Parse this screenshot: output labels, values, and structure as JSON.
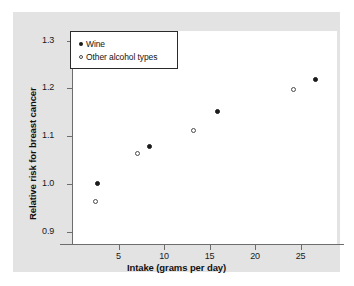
{
  "chart_data": {
    "type": "scatter",
    "title": "",
    "xlabel": "Intake (grams per day)",
    "ylabel": "Relative risk for breast cancer",
    "xlim": [
      0,
      29
    ],
    "ylim": [
      0.875,
      1.32
    ],
    "xticks": [
      5,
      10,
      15,
      20,
      25
    ],
    "xticklabels": [
      "5",
      "10",
      "15",
      "20",
      "25"
    ],
    "yticks": [
      0.9,
      1.0,
      1.1,
      1.2,
      1.3
    ],
    "yticklabels": [
      "0.9",
      "1.0",
      "1.1",
      "1.2",
      "1.3"
    ],
    "grid": false,
    "legend_position": "upper left",
    "series": [
      {
        "name": "Wine",
        "marker": "filled-circle",
        "color": "#1b1b1b",
        "points": [
          {
            "x": 2.7,
            "y": 1.0
          },
          {
            "x": 8.5,
            "y": 1.078
          },
          {
            "x": 15.9,
            "y": 1.151
          },
          {
            "x": 26.7,
            "y": 1.218
          }
        ]
      },
      {
        "name": "Other alcohol types",
        "marker": "open-circle",
        "color": "#ffffff",
        "points": [
          {
            "x": 2.5,
            "y": 0.963
          },
          {
            "x": 7.1,
            "y": 1.063
          },
          {
            "x": 13.3,
            "y": 1.111
          },
          {
            "x": 24.3,
            "y": 1.197
          }
        ]
      }
    ]
  },
  "legend": {
    "items": [
      {
        "label": "Wine"
      },
      {
        "label": "Other alcohol types"
      }
    ]
  },
  "colors": {
    "figure_background": "#e3e3e3",
    "plot_background": "#ffffff",
    "axis": "#6d6d6d",
    "text": "#111111",
    "marker_filled": "#1b1b1b",
    "marker_open_edge": "#4a4a4a"
  }
}
